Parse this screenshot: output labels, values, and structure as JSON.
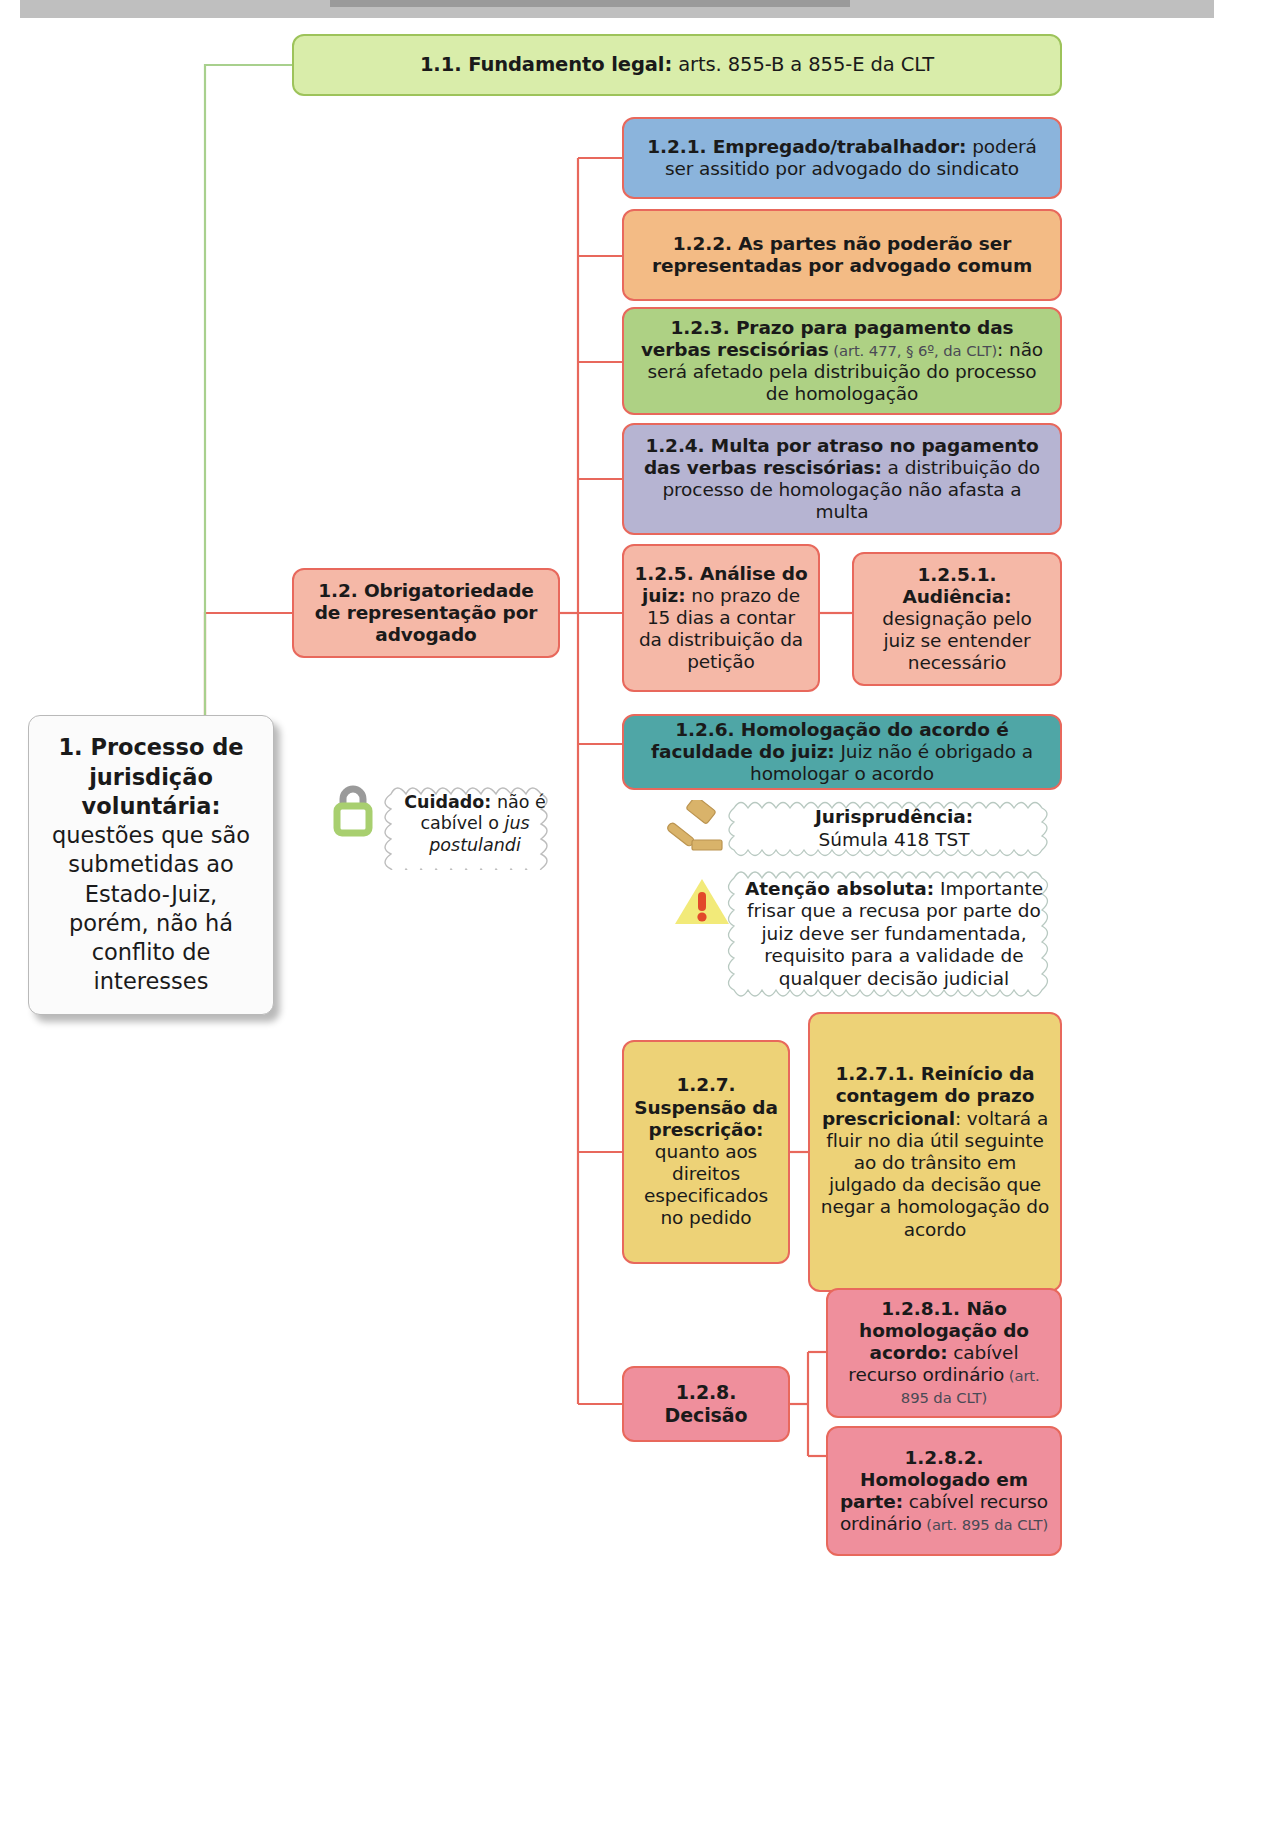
{
  "page": {
    "top_bar_present": true
  },
  "colors": {
    "connector": "#e8685c",
    "connector_root": "#a8d08d",
    "green_fundamento": "#d9edaa",
    "blue": "#8bb4dc",
    "orange": "#f3bb85",
    "olive_green": "#aed184",
    "purple": "#b6b4d2",
    "salmon": "#f5b8a7",
    "teal": "#4fa6a6",
    "amber": "#edd277",
    "pink": "#ef8f9c",
    "root_bg": "#fbfbfb",
    "lock_icon": "#a8cf6f",
    "gavel_icon": "#d9b36a",
    "warning_icon": "#f2ea79"
  },
  "root": {
    "number": "1. Processo de jurisdição voluntária:",
    "body": " questões que são submetidas ao Estado-Juiz, porém, não há conflito de interesses"
  },
  "nodes": {
    "n11": {
      "bold": "1.1. Fundamento legal:",
      "rest": " arts. 855-B a 855-E da CLT"
    },
    "n12": {
      "bold": "1.2. Obrigatoriedade de representação por advogado",
      "rest": ""
    },
    "n121": {
      "bold": "1.2.1. Empregado/trabalhador:",
      "rest": " poderá ser assitido por advogado do sindicato"
    },
    "n122": {
      "bold": "1.2.2. As partes não poderão ser representadas por advogado comum",
      "rest": ""
    },
    "n123": {
      "bold": "1.2.3. Prazo para pagamento das verbas rescisórias",
      "ref": " (art. 477, § 6º, da CLT)",
      "rest": ": não será afetado pela distribuição do processo de homologação"
    },
    "n124": {
      "bold": "1.2.4. Multa por atraso no pagamento das verbas rescisórias:",
      "rest": " a distribuição do processo de homologação não afasta a multa"
    },
    "n125": {
      "bold": "1.2.5. Análise do juiz:",
      "rest": " no prazo de 15 dias a contar da distribuição da petição"
    },
    "n1251": {
      "bold": "1.2.5.1. Audiência:",
      "rest": " designação pelo juiz se entender necessário"
    },
    "n126": {
      "bold": "1.2.6. Homologação do acordo é faculdade do juiz:",
      "rest": " Juiz não é obrigado a homologar o acordo"
    },
    "n127": {
      "bold": "1.2.7. Suspensão da prescrição:",
      "rest": " quanto aos direitos especificados no pedido"
    },
    "n1271": {
      "bold": "1.2.7.1. Reinício da contagem do prazo prescricional",
      "rest": ": voltará a fluir no dia útil seguinte ao do trânsito em julgado da decisão que negar a homologação do acordo"
    },
    "n128": {
      "bold": "1.2.8. Decisão",
      "rest": ""
    },
    "n1281": {
      "bold": "1.2.8.1. Não homologação do acordo:",
      "rest": " cabível recurso ordinário",
      "ref": " (art. 895 da CLT)"
    },
    "n1282": {
      "bold": "1.2.8.2. Homologado em parte:",
      "rest": " cabível recurso ordinário",
      "ref": " (art. 895 da CLT)"
    }
  },
  "callouts": {
    "cuidado": {
      "icon": "lock-icon",
      "bold": "Cuidado:",
      "rest": " não é cabível o ",
      "italic": "jus postulandi"
    },
    "jurisprudencia": {
      "icon": "gavel-icon",
      "bold": "Jurisprudência:",
      "rest": " Súmula 418 TST"
    },
    "atencao": {
      "icon": "warning-triangle-icon",
      "bold": "Atenção absoluta:",
      "rest": " Importante frisar que a recusa por parte do juiz deve ser fundamentada, requisito para a validade de qualquer decisão judicial"
    }
  }
}
